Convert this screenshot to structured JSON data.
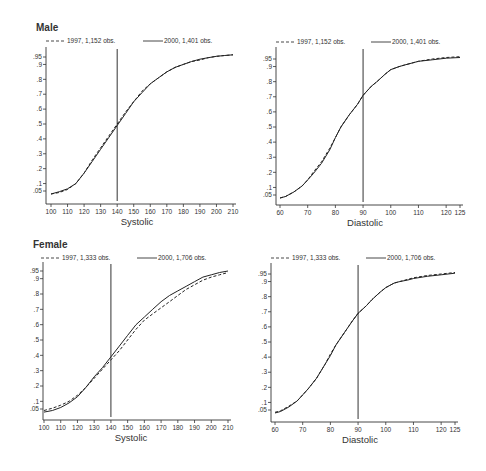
{
  "chart_data": [
    {
      "type": "line",
      "panel": "male-systolic",
      "title": "Male",
      "xlabel": "Systolic",
      "ylabel": "",
      "xlim": [
        100,
        210
      ],
      "ylim": [
        0.05,
        0.95
      ],
      "x_ticks": [
        100,
        110,
        120,
        130,
        140,
        150,
        160,
        170,
        180,
        190,
        200,
        210
      ],
      "y_ticks": [
        ".05",
        ".1",
        ".2",
        ".3",
        ".4",
        ".5",
        ".6",
        ".7",
        ".8",
        ".9",
        ".95"
      ],
      "reference_line_x": 140,
      "legend": [
        "1997, 1,152 obs.",
        "2000, 1,401 obs."
      ],
      "series": [
        {
          "name": "1997, 1,152 obs.",
          "style": "dashed",
          "x": [
            100,
            105,
            110,
            115,
            120,
            125,
            130,
            135,
            140,
            145,
            150,
            155,
            160,
            165,
            170,
            175,
            180,
            185,
            190,
            195,
            200,
            205,
            210
          ],
          "y": [
            0.03,
            0.04,
            0.06,
            0.1,
            0.17,
            0.26,
            0.34,
            0.42,
            0.5,
            0.58,
            0.65,
            0.72,
            0.77,
            0.81,
            0.85,
            0.88,
            0.9,
            0.92,
            0.93,
            0.945,
            0.955,
            0.96,
            0.965
          ]
        },
        {
          "name": "2000, 1,401 obs.",
          "style": "solid",
          "x": [
            100,
            105,
            110,
            115,
            120,
            125,
            130,
            135,
            140,
            145,
            150,
            155,
            160,
            165,
            170,
            175,
            180,
            185,
            190,
            195,
            200,
            205,
            210
          ],
          "y": [
            0.03,
            0.045,
            0.065,
            0.1,
            0.17,
            0.25,
            0.33,
            0.41,
            0.49,
            0.57,
            0.65,
            0.71,
            0.77,
            0.81,
            0.85,
            0.88,
            0.9,
            0.92,
            0.935,
            0.945,
            0.955,
            0.96,
            0.965
          ]
        }
      ]
    },
    {
      "type": "line",
      "panel": "male-diastolic",
      "title": "",
      "xlabel": "Diastolic",
      "ylabel": "",
      "xlim": [
        60,
        125
      ],
      "ylim": [
        0.05,
        0.95
      ],
      "x_ticks": [
        60,
        70,
        80,
        90,
        100,
        110,
        120,
        125
      ],
      "y_ticks": [
        ".05",
        ".1",
        ".2",
        ".3",
        ".4",
        ".5",
        ".6",
        ".7",
        ".8",
        ".9",
        ".95"
      ],
      "reference_line_x": 90,
      "legend": [
        "1997, 1,152 obs.",
        "2000, 1,401 obs."
      ],
      "series": [
        {
          "name": "1997, 1,152 obs.",
          "style": "dashed",
          "x": [
            60,
            62,
            65,
            68,
            70,
            72,
            75,
            78,
            80,
            82,
            85,
            88,
            90,
            93,
            95,
            98,
            100,
            103,
            105,
            108,
            110,
            115,
            120,
            125
          ],
          "y": [
            0.03,
            0.04,
            0.07,
            0.11,
            0.15,
            0.2,
            0.27,
            0.36,
            0.43,
            0.5,
            0.58,
            0.65,
            0.71,
            0.77,
            0.8,
            0.85,
            0.88,
            0.9,
            0.91,
            0.925,
            0.935,
            0.95,
            0.96,
            0.965
          ]
        },
        {
          "name": "2000, 1,401 obs.",
          "style": "solid",
          "x": [
            60,
            62,
            65,
            68,
            70,
            72,
            75,
            78,
            80,
            82,
            85,
            88,
            90,
            93,
            95,
            98,
            100,
            103,
            105,
            108,
            110,
            115,
            120,
            125
          ],
          "y": [
            0.03,
            0.04,
            0.07,
            0.11,
            0.15,
            0.19,
            0.26,
            0.35,
            0.43,
            0.5,
            0.58,
            0.65,
            0.71,
            0.77,
            0.8,
            0.85,
            0.88,
            0.9,
            0.91,
            0.925,
            0.935,
            0.945,
            0.955,
            0.96
          ]
        }
      ]
    },
    {
      "type": "line",
      "panel": "female-systolic",
      "title": "Female",
      "xlabel": "Systolic",
      "ylabel": "",
      "xlim": [
        100,
        210
      ],
      "ylim": [
        0.05,
        0.95
      ],
      "x_ticks": [
        100,
        110,
        120,
        130,
        140,
        150,
        160,
        170,
        180,
        190,
        200,
        210
      ],
      "y_ticks": [
        ".05",
        ".1",
        ".2",
        ".3",
        ".4",
        ".5",
        ".6",
        ".7",
        ".8",
        ".9",
        ".95"
      ],
      "reference_line_x": 140,
      "legend": [
        "1997, 1,333 obs.",
        "2000, 1,706 obs."
      ],
      "series": [
        {
          "name": "1997, 1,333 obs.",
          "style": "dashed",
          "x": [
            100,
            105,
            110,
            115,
            120,
            125,
            130,
            135,
            140,
            145,
            150,
            155,
            160,
            165,
            170,
            175,
            180,
            185,
            190,
            195,
            200,
            205,
            210
          ],
          "y": [
            0.04,
            0.055,
            0.075,
            0.1,
            0.14,
            0.19,
            0.25,
            0.31,
            0.37,
            0.43,
            0.5,
            0.57,
            0.63,
            0.67,
            0.71,
            0.75,
            0.79,
            0.83,
            0.86,
            0.89,
            0.91,
            0.925,
            0.94
          ]
        },
        {
          "name": "2000, 1,706 obs.",
          "style": "solid",
          "x": [
            100,
            105,
            110,
            115,
            120,
            125,
            130,
            135,
            140,
            145,
            150,
            155,
            160,
            165,
            170,
            175,
            180,
            185,
            190,
            195,
            200,
            205,
            210
          ],
          "y": [
            0.03,
            0.04,
            0.06,
            0.09,
            0.13,
            0.19,
            0.26,
            0.32,
            0.39,
            0.46,
            0.53,
            0.6,
            0.65,
            0.7,
            0.75,
            0.79,
            0.82,
            0.85,
            0.88,
            0.91,
            0.925,
            0.94,
            0.95
          ]
        }
      ]
    },
    {
      "type": "line",
      "panel": "female-diastolic",
      "title": "",
      "xlabel": "Diastolic",
      "ylabel": "",
      "xlim": [
        60,
        125
      ],
      "ylim": [
        0.05,
        0.95
      ],
      "x_ticks": [
        60,
        70,
        80,
        90,
        100,
        110,
        120,
        125
      ],
      "y_ticks": [
        ".05",
        ".1",
        ".2",
        ".3",
        ".4",
        ".5",
        ".6",
        ".7",
        ".8",
        ".9",
        ".95"
      ],
      "reference_line_x": 90,
      "legend": [
        "1997, 1,333 obs.",
        "2000, 1,706 obs."
      ],
      "series": [
        {
          "name": "1997, 1,333 obs.",
          "style": "dashed",
          "x": [
            60,
            62,
            65,
            68,
            70,
            72,
            75,
            78,
            80,
            82,
            85,
            88,
            90,
            93,
            95,
            98,
            100,
            103,
            105,
            108,
            110,
            115,
            120,
            125
          ],
          "y": [
            0.035,
            0.045,
            0.075,
            0.11,
            0.15,
            0.19,
            0.26,
            0.35,
            0.42,
            0.48,
            0.56,
            0.64,
            0.69,
            0.74,
            0.78,
            0.83,
            0.86,
            0.89,
            0.9,
            0.915,
            0.925,
            0.94,
            0.95,
            0.96
          ]
        },
        {
          "name": "2000, 1,706 obs.",
          "style": "solid",
          "x": [
            60,
            62,
            65,
            68,
            70,
            72,
            75,
            78,
            80,
            82,
            85,
            88,
            90,
            93,
            95,
            98,
            100,
            103,
            105,
            108,
            110,
            115,
            120,
            125
          ],
          "y": [
            0.03,
            0.04,
            0.07,
            0.11,
            0.15,
            0.19,
            0.26,
            0.35,
            0.41,
            0.48,
            0.56,
            0.64,
            0.69,
            0.74,
            0.78,
            0.83,
            0.86,
            0.89,
            0.9,
            0.91,
            0.92,
            0.935,
            0.945,
            0.955
          ]
        }
      ]
    }
  ],
  "panels": {
    "male_title": "Male",
    "female_title": "Female"
  }
}
